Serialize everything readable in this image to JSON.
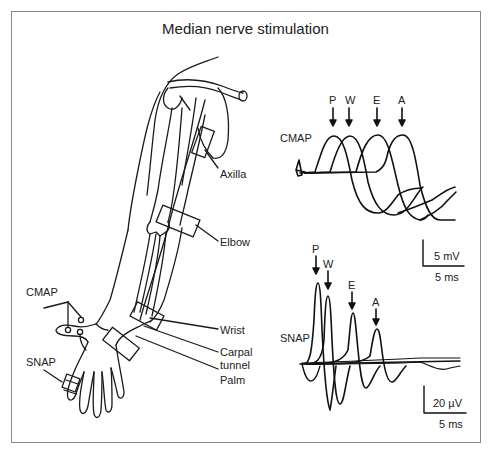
{
  "figure": {
    "title": "Median nerve stimulation",
    "frame_color": "#8a8a8a",
    "line_color": "#1a1a1a"
  },
  "arm_diagram": {
    "stimulation_sites": [
      {
        "id": "axilla",
        "label": "Axilla"
      },
      {
        "id": "elbow",
        "label": "Elbow"
      },
      {
        "id": "wrist",
        "label": "Wrist"
      },
      {
        "id": "carpal_tunnel",
        "label_line1": "Carpal",
        "label_line2": "tunnel"
      },
      {
        "id": "palm",
        "label": "Palm"
      }
    ],
    "recording_sites": [
      {
        "id": "cmap",
        "label": "CMAP"
      },
      {
        "id": "snap",
        "label": "SNAP"
      }
    ]
  },
  "traces": {
    "cmap": {
      "label": "CMAP",
      "markers": [
        "P",
        "W",
        "E",
        "A"
      ],
      "scale_voltage": "5 mV",
      "scale_time": "5 ms"
    },
    "snap": {
      "label": "SNAP",
      "markers": [
        "P",
        "W",
        "E",
        "A"
      ],
      "scale_voltage": "20 µV",
      "scale_time": "5 ms"
    }
  },
  "marker_legend_note": "P = Palm, W = Wrist, E = Elbow, A = Axilla"
}
